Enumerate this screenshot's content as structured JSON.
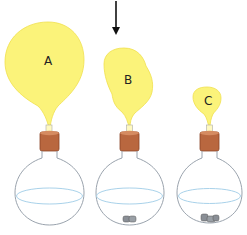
{
  "figure": {
    "arrow": {
      "direction": "down",
      "points_to": "B"
    },
    "colors": {
      "balloon": "#fbf37a",
      "balloon_edge": "#f2e24a",
      "stopper": "#b9673f",
      "stopper_dark": "#8a4426",
      "flask_outline": "#9aa3ad",
      "liquid_line": "#a9d2ea",
      "residue": "#8a8f96"
    },
    "flasks": [
      {
        "label": "A",
        "balloon_size": "large",
        "residue": false
      },
      {
        "label": "B",
        "balloon_size": "medium",
        "residue": true
      },
      {
        "label": "C",
        "balloon_size": "small",
        "residue": true
      }
    ]
  }
}
